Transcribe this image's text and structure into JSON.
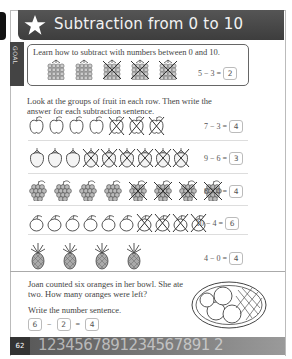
{
  "header": {
    "title": "Subtraction from 0 to 10",
    "icon": "star-icon"
  },
  "goal": {
    "label": "GOAL",
    "text": "Learn how to subtract with numbers between 0 and 10.",
    "fruit": "blackberry",
    "total": 5,
    "crossed": 3,
    "equation": {
      "a": "5",
      "op": "−",
      "b": "3",
      "eq": "=",
      "answer": "2"
    }
  },
  "instructions": "Look at the groups of fruit in each row. Then write the answer for each subtraction sentence.",
  "rows": [
    {
      "fruit": "apple",
      "total": 7,
      "crossed": 3,
      "a": "7",
      "op": "−",
      "b": "3",
      "eq": "=",
      "answer": "4"
    },
    {
      "fruit": "strawberry",
      "total": 9,
      "crossed": 6,
      "a": "9",
      "op": "−",
      "b": "6",
      "eq": "=",
      "answer": "3"
    },
    {
      "fruit": "grapes",
      "total": 8,
      "crossed": 4,
      "a": "8",
      "op": "−",
      "b": "4",
      "eq": "=",
      "answer": "4"
    },
    {
      "fruit": "lemon",
      "total": 10,
      "crossed": 4,
      "a": "10",
      "op": "−",
      "b": "4",
      "eq": "=",
      "answer": "6"
    },
    {
      "fruit": "pineapple",
      "total": 4,
      "crossed": 0,
      "a": "4",
      "op": "−",
      "b": "0",
      "eq": "=",
      "answer": "4"
    }
  ],
  "story": {
    "line1": "Joan counted six oranges in her bowl. She ate two. How many oranges were left?",
    "line2": "Write the number sentence.",
    "equation": {
      "a": "6",
      "op": "−",
      "b": "2",
      "eq": "=",
      "answer": "4"
    },
    "image": "bowl-of-oranges"
  },
  "footer": {
    "page_number": "62",
    "digits": "1234567891234567891 2"
  },
  "colors": {
    "header_bg": "#474747",
    "header_text": "#f2f2f2",
    "footer_bg": "#6e6e6e"
  }
}
